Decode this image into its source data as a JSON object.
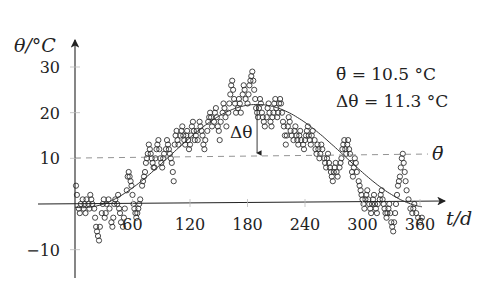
{
  "chart_data": {
    "type": "scatter",
    "title": "",
    "xlabel": "t/d",
    "ylabel": "θ/°C",
    "xlim": [
      0,
      380
    ],
    "ylim": [
      -15,
      33
    ],
    "x_ticks": [
      60,
      120,
      180,
      240,
      300,
      360
    ],
    "y_ticks": [
      -10,
      10,
      20,
      30
    ],
    "grid": false,
    "annotations": {
      "mean_label": "θ̄ = 10.5 °C",
      "amplitude_label": "Δθ = 11.3 °C",
      "delta_label": "Δθ",
      "mean_line_label": "θ̄"
    },
    "mean": 10.5,
    "amplitude": 11.3,
    "fit": {
      "formula": "10.5 + 11.3*cos(2*pi*(t-190)/365)",
      "mean": 10.5,
      "amplitude": 11.3,
      "peak_day": 190,
      "t_range": [
        0,
        362
      ]
    },
    "series": [
      {
        "name": "daily mean temperature",
        "marker": "open-circle",
        "points": [
          [
            1,
            4
          ],
          [
            2,
            2
          ],
          [
            4,
            -1
          ],
          [
            5,
            -2
          ],
          [
            6,
            0
          ],
          [
            8,
            1
          ],
          [
            9,
            -1
          ],
          [
            10,
            0
          ],
          [
            11,
            -2
          ],
          [
            12,
            1
          ],
          [
            14,
            0
          ],
          [
            15,
            -1
          ],
          [
            16,
            2
          ],
          [
            17,
            1
          ],
          [
            18,
            0
          ],
          [
            20,
            -1
          ],
          [
            21,
            -3
          ],
          [
            22,
            -5
          ],
          [
            23,
            -6
          ],
          [
            24,
            -7
          ],
          [
            25,
            -8
          ],
          [
            26,
            -5
          ],
          [
            28,
            -2
          ],
          [
            29,
            0
          ],
          [
            30,
            1
          ],
          [
            31,
            -3
          ],
          [
            32,
            -2
          ],
          [
            33,
            0
          ],
          [
            35,
            1
          ],
          [
            36,
            -1
          ],
          [
            38,
            -4
          ],
          [
            39,
            -5
          ],
          [
            40,
            -3
          ],
          [
            41,
            0
          ],
          [
            42,
            1
          ],
          [
            44,
            0
          ],
          [
            45,
            2
          ],
          [
            46,
            -1
          ],
          [
            47,
            -2
          ],
          [
            48,
            -4
          ],
          [
            50,
            -5
          ],
          [
            51,
            -3
          ],
          [
            52,
            -1
          ],
          [
            54,
            3
          ],
          [
            55,
            6
          ],
          [
            56,
            7
          ],
          [
            57,
            6
          ],
          [
            58,
            5
          ],
          [
            59,
            4
          ],
          [
            60,
            2
          ],
          [
            61,
            0
          ],
          [
            62,
            -1
          ],
          [
            63,
            -2
          ],
          [
            64,
            -3
          ],
          [
            65,
            -2
          ],
          [
            66,
            -1
          ],
          [
            67,
            0
          ],
          [
            68,
            1
          ],
          [
            70,
            4
          ],
          [
            71,
            5
          ],
          [
            72,
            6
          ],
          [
            73,
            7
          ],
          [
            74,
            9
          ],
          [
            75,
            10
          ],
          [
            76,
            11
          ],
          [
            77,
            13
          ],
          [
            78,
            12
          ],
          [
            79,
            11
          ],
          [
            80,
            10
          ],
          [
            81,
            9
          ],
          [
            82,
            8
          ],
          [
            83,
            8
          ],
          [
            84,
            10
          ],
          [
            85,
            12
          ],
          [
            86,
            13
          ],
          [
            87,
            14
          ],
          [
            88,
            12
          ],
          [
            89,
            10
          ],
          [
            90,
            9
          ],
          [
            91,
            8
          ],
          [
            92,
            10
          ],
          [
            93,
            11
          ],
          [
            95,
            12
          ],
          [
            96,
            14
          ],
          [
            97,
            13
          ],
          [
            98,
            12
          ],
          [
            99,
            11
          ],
          [
            100,
            10
          ],
          [
            101,
            9
          ],
          [
            102,
            7
          ],
          [
            103,
            5
          ],
          [
            104,
            13
          ],
          [
            105,
            15
          ],
          [
            106,
            16
          ],
          [
            107,
            14
          ],
          [
            108,
            13
          ],
          [
            110,
            15
          ],
          [
            111,
            16
          ],
          [
            112,
            17
          ],
          [
            113,
            15
          ],
          [
            114,
            14
          ],
          [
            115,
            13
          ],
          [
            116,
            15
          ],
          [
            117,
            16
          ],
          [
            118,
            14
          ],
          [
            119,
            12
          ],
          [
            120,
            13
          ],
          [
            121,
            15
          ],
          [
            122,
            17
          ],
          [
            123,
            18
          ],
          [
            124,
            16
          ],
          [
            125,
            14
          ],
          [
            126,
            15
          ],
          [
            127,
            16
          ],
          [
            128,
            14
          ],
          [
            130,
            18
          ],
          [
            131,
            17
          ],
          [
            132,
            16
          ],
          [
            133,
            15
          ],
          [
            134,
            13
          ],
          [
            135,
            12
          ],
          [
            136,
            14
          ],
          [
            138,
            16
          ],
          [
            139,
            18
          ],
          [
            140,
            19
          ],
          [
            141,
            20
          ],
          [
            142,
            19
          ],
          [
            143,
            17
          ],
          [
            145,
            18
          ],
          [
            146,
            20
          ],
          [
            147,
            21
          ],
          [
            148,
            19
          ],
          [
            149,
            17
          ],
          [
            150,
            16
          ],
          [
            151,
            14
          ],
          [
            152,
            18
          ],
          [
            154,
            20
          ],
          [
            155,
            22
          ],
          [
            156,
            21
          ],
          [
            157,
            19
          ],
          [
            158,
            17
          ],
          [
            160,
            20
          ],
          [
            161,
            22
          ],
          [
            162,
            24
          ],
          [
            163,
            26
          ],
          [
            164,
            27
          ],
          [
            165,
            25
          ],
          [
            166,
            23
          ],
          [
            167,
            22
          ],
          [
            168,
            20
          ],
          [
            170,
            21
          ],
          [
            171,
            23
          ],
          [
            172,
            22
          ],
          [
            173,
            20
          ],
          [
            175,
            24
          ],
          [
            176,
            26
          ],
          [
            177,
            25
          ],
          [
            178,
            23
          ],
          [
            180,
            22
          ],
          [
            181,
            24
          ],
          [
            182,
            26
          ],
          [
            183,
            27
          ],
          [
            184,
            28
          ],
          [
            185,
            29
          ],
          [
            186,
            27
          ],
          [
            187,
            25
          ],
          [
            188,
            23
          ],
          [
            189,
            21
          ],
          [
            190,
            20
          ],
          [
            191,
            19
          ],
          [
            192,
            21
          ],
          [
            193,
            23
          ],
          [
            194,
            22
          ],
          [
            195,
            20
          ],
          [
            196,
            19
          ],
          [
            197,
            18
          ],
          [
            198,
            17
          ],
          [
            200,
            19
          ],
          [
            201,
            21
          ],
          [
            202,
            22
          ],
          [
            203,
            20
          ],
          [
            204,
            18
          ],
          [
            205,
            17
          ],
          [
            206,
            19
          ],
          [
            207,
            20
          ],
          [
            208,
            22
          ],
          [
            209,
            23
          ],
          [
            210,
            21
          ],
          [
            211,
            19
          ],
          [
            212,
            20
          ],
          [
            213,
            22
          ],
          [
            214,
            23
          ],
          [
            215,
            22
          ],
          [
            216,
            20
          ],
          [
            217,
            18
          ],
          [
            218,
            17
          ],
          [
            219,
            15
          ],
          [
            220,
            13
          ],
          [
            221,
            15
          ],
          [
            222,
            17
          ],
          [
            223,
            19
          ],
          [
            224,
            18
          ],
          [
            225,
            16
          ],
          [
            226,
            15
          ],
          [
            228,
            14
          ],
          [
            229,
            16
          ],
          [
            230,
            17
          ],
          [
            231,
            15
          ],
          [
            232,
            14
          ],
          [
            233,
            13
          ],
          [
            234,
            15
          ],
          [
            235,
            16
          ],
          [
            236,
            14
          ],
          [
            238,
            13
          ],
          [
            239,
            12
          ],
          [
            240,
            14
          ],
          [
            241,
            15
          ],
          [
            242,
            16
          ],
          [
            243,
            17
          ],
          [
            244,
            15
          ],
          [
            245,
            14
          ],
          [
            246,
            13
          ],
          [
            247,
            15
          ],
          [
            248,
            16
          ],
          [
            250,
            14
          ],
          [
            251,
            12
          ],
          [
            252,
            11
          ],
          [
            253,
            13
          ],
          [
            254,
            12
          ],
          [
            255,
            10
          ],
          [
            256,
            11
          ],
          [
            257,
            13
          ],
          [
            258,
            12
          ],
          [
            260,
            10
          ],
          [
            261,
            9
          ],
          [
            262,
            8
          ],
          [
            263,
            10
          ],
          [
            264,
            11
          ],
          [
            265,
            9
          ],
          [
            266,
            8
          ],
          [
            267,
            7
          ],
          [
            268,
            6
          ],
          [
            269,
            5
          ],
          [
            270,
            7
          ],
          [
            271,
            8
          ],
          [
            272,
            9
          ],
          [
            273,
            7
          ],
          [
            274,
            6
          ],
          [
            276,
            8
          ],
          [
            277,
            9
          ],
          [
            278,
            10
          ],
          [
            279,
            12
          ],
          [
            280,
            13
          ],
          [
            281,
            14
          ],
          [
            282,
            12
          ],
          [
            283,
            11
          ],
          [
            284,
            13
          ],
          [
            285,
            14
          ],
          [
            286,
            12
          ],
          [
            287,
            11
          ],
          [
            288,
            9
          ],
          [
            289,
            7
          ],
          [
            290,
            6
          ],
          [
            291,
            8
          ],
          [
            292,
            10
          ],
          [
            293,
            9
          ],
          [
            294,
            7
          ],
          [
            296,
            5
          ],
          [
            297,
            4
          ],
          [
            298,
            3
          ],
          [
            299,
            2
          ],
          [
            300,
            1
          ],
          [
            301,
            0
          ],
          [
            302,
            -1
          ],
          [
            303,
            1
          ],
          [
            304,
            2
          ],
          [
            305,
            3
          ],
          [
            306,
            1
          ],
          [
            307,
            0
          ],
          [
            308,
            -1
          ],
          [
            309,
            -2
          ],
          [
            310,
            0
          ],
          [
            311,
            1
          ],
          [
            312,
            2
          ],
          [
            313,
            0
          ],
          [
            314,
            -1
          ],
          [
            315,
            -2
          ],
          [
            316,
            0
          ],
          [
            318,
            1
          ],
          [
            319,
            2
          ],
          [
            320,
            3
          ],
          [
            321,
            1
          ],
          [
            322,
            0
          ],
          [
            323,
            -1
          ],
          [
            324,
            -2
          ],
          [
            325,
            -3
          ],
          [
            326,
            -2
          ],
          [
            327,
            -1
          ],
          [
            328,
            0
          ],
          [
            329,
            -2
          ],
          [
            330,
            -4
          ],
          [
            331,
            -5
          ],
          [
            332,
            -6
          ],
          [
            333,
            -4
          ],
          [
            334,
            -2
          ],
          [
            335,
            0
          ],
          [
            336,
            2
          ],
          [
            337,
            4
          ],
          [
            338,
            5
          ],
          [
            339,
            6
          ],
          [
            340,
            8
          ],
          [
            341,
            10
          ],
          [
            342,
            11
          ],
          [
            343,
            9
          ],
          [
            344,
            7
          ],
          [
            345,
            5
          ],
          [
            346,
            3
          ],
          [
            348,
            1
          ],
          [
            350,
            -1
          ],
          [
            352,
            -2
          ],
          [
            353,
            -1
          ],
          [
            354,
            0
          ],
          [
            356,
            -2
          ],
          [
            358,
            -3
          ],
          [
            360,
            -4
          ],
          [
            362,
            -3
          ]
        ]
      }
    ]
  }
}
